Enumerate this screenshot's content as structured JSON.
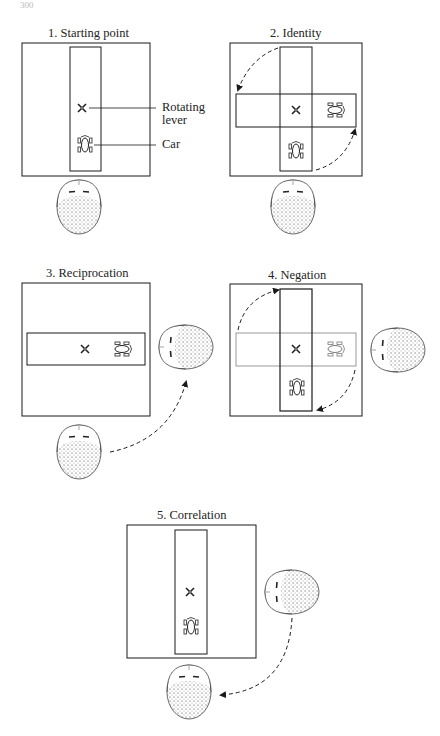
{
  "page_number": "300",
  "panels": [
    {
      "id": 1,
      "title": "1. Starting point",
      "labels": {
        "lever_line1": "Rotating",
        "lever_line2": "lever",
        "car": "Car"
      }
    },
    {
      "id": 2,
      "title": "2. Identity"
    },
    {
      "id": 3,
      "title": "3. Reciprocation"
    },
    {
      "id": 4,
      "title": "4. Negation"
    },
    {
      "id": 5,
      "title": "5. Correlation"
    }
  ],
  "colors": {
    "ink": "#1a1a1a",
    "background": "#ffffff"
  }
}
